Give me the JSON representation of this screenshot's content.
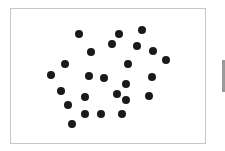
{
  "frame": {
    "border_color": "#c8c8c8",
    "background": "#ffffff"
  },
  "dot_color": "#1a1a1a",
  "dot_count": 25,
  "dots": [
    {
      "x": 79,
      "y": 34
    },
    {
      "x": 119,
      "y": 34
    },
    {
      "x": 142,
      "y": 30
    },
    {
      "x": 112,
      "y": 44
    },
    {
      "x": 137,
      "y": 46
    },
    {
      "x": 153,
      "y": 51
    },
    {
      "x": 91,
      "y": 52
    },
    {
      "x": 166,
      "y": 60
    },
    {
      "x": 65,
      "y": 64
    },
    {
      "x": 128,
      "y": 64
    },
    {
      "x": 51,
      "y": 75
    },
    {
      "x": 89,
      "y": 76
    },
    {
      "x": 104,
      "y": 78
    },
    {
      "x": 152,
      "y": 77
    },
    {
      "x": 126,
      "y": 84
    },
    {
      "x": 61,
      "y": 91
    },
    {
      "x": 85,
      "y": 97
    },
    {
      "x": 117,
      "y": 94
    },
    {
      "x": 149,
      "y": 96
    },
    {
      "x": 126,
      "y": 100
    },
    {
      "x": 68,
      "y": 105
    },
    {
      "x": 85,
      "y": 114
    },
    {
      "x": 101,
      "y": 114
    },
    {
      "x": 122,
      "y": 114
    },
    {
      "x": 72,
      "y": 124
    }
  ],
  "side_tab_color": "#9a9a9a"
}
